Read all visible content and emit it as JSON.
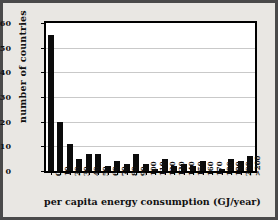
{
  "chart_data": {
    "type": "bar",
    "title": "",
    "xlabel": "per capita energy consumption (GJ/year)",
    "ylabel": "number of countries",
    "ylim": [
      0,
      60
    ],
    "yticks": [
      0,
      10,
      20,
      30,
      40,
      50,
      60
    ],
    "grid": true,
    "legend": "none",
    "categories": [
      "0",
      "10",
      "20",
      "30",
      "40",
      "50",
      "60",
      "70",
      "80",
      "90",
      "100",
      "110",
      "120",
      "130",
      "140",
      "150",
      "160",
      "170",
      "180",
      "190",
      "200",
      ">200"
    ],
    "tick_labels": [
      "0",
      "10",
      "20",
      "30",
      "40",
      "50",
      "60",
      "70",
      "80",
      "90",
      "100",
      "110",
      "120",
      "130",
      "140",
      "150",
      "160",
      "170",
      "180",
      "190",
      "200",
      ">200"
    ],
    "values": [
      55,
      20,
      11,
      5,
      7,
      7,
      2,
      4,
      3,
      7,
      3,
      1,
      5,
      2,
      3,
      2,
      4,
      0,
      1,
      5,
      4,
      6
    ],
    "bar_color": "#0b0b0b",
    "plot_background": "#ffffff",
    "page_background": "#e9e7e3",
    "frame_color": "#4a4a4a",
    "gridline_color": "#c9c9c9"
  }
}
